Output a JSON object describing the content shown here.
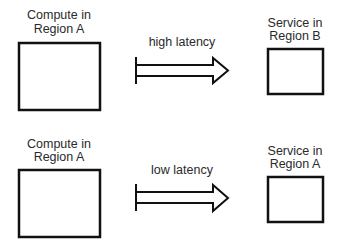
{
  "diagram": {
    "rows": [
      {
        "source": {
          "label_line1": "Compute in",
          "label_line2": "Region A"
        },
        "arrow": {
          "label": "high latency"
        },
        "target": {
          "label_line1": "Service in",
          "label_line2": "Region B"
        }
      },
      {
        "source": {
          "label_line1": "Compute in",
          "label_line2": "Region A"
        },
        "arrow": {
          "label": "low latency"
        },
        "target": {
          "label_line1": "Service in",
          "label_line2": "Region A"
        }
      }
    ]
  }
}
